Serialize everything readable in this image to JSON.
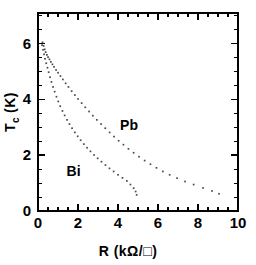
{
  "chart_data": {
    "type": "scatter",
    "title": "",
    "subtitle": "",
    "xlabel": "R (kΩ/□)",
    "xlabel_main": "R",
    "xlabel_units": "(kΩ/□)",
    "ylabel": "T_c (K)",
    "ylabel_main": "T",
    "ylabel_sub": "c",
    "ylabel_units": "(K)",
    "xlim": [
      0,
      10
    ],
    "ylim": [
      0,
      7.1
    ],
    "xticks": [
      0,
      2,
      4,
      6,
      8,
      10
    ],
    "xtick_labels": [
      "0",
      "2",
      "4",
      "6",
      "8",
      "10"
    ],
    "yticks": [
      0,
      2,
      4,
      6
    ],
    "ytick_labels": [
      "0",
      "2",
      "4",
      "6"
    ],
    "x_minor_interval": 0.5,
    "y_minor_interval": 0.5,
    "grid": false,
    "legend_position": "inline-annotation",
    "marker": "dotted-small",
    "marker_color": "#4a4a4a",
    "series": [
      {
        "name": "Pb",
        "label": "Pb",
        "label_x": 4.55,
        "label_y": 2.92,
        "points": [
          [
            0.22,
            6.05
          ],
          [
            0.28,
            5.92
          ],
          [
            0.33,
            5.8
          ],
          [
            0.38,
            5.7
          ],
          [
            0.44,
            5.6
          ],
          [
            0.5,
            5.52
          ],
          [
            0.57,
            5.44
          ],
          [
            0.64,
            5.35
          ],
          [
            0.72,
            5.26
          ],
          [
            0.8,
            5.17
          ],
          [
            0.9,
            5.06
          ],
          [
            1.0,
            4.96
          ],
          [
            1.12,
            4.84
          ],
          [
            1.24,
            4.72
          ],
          [
            1.38,
            4.58
          ],
          [
            1.52,
            4.45
          ],
          [
            1.68,
            4.3
          ],
          [
            1.84,
            4.16
          ],
          [
            2.0,
            4.02
          ],
          [
            2.18,
            3.87
          ],
          [
            2.36,
            3.72
          ],
          [
            2.55,
            3.57
          ],
          [
            2.74,
            3.42
          ],
          [
            2.94,
            3.27
          ],
          [
            3.15,
            3.12
          ],
          [
            3.36,
            2.97
          ],
          [
            3.58,
            2.82
          ],
          [
            3.8,
            2.67
          ],
          [
            4.03,
            2.52
          ],
          [
            4.27,
            2.38
          ],
          [
            4.52,
            2.23
          ],
          [
            4.78,
            2.09
          ],
          [
            5.05,
            1.95
          ],
          [
            5.33,
            1.81
          ],
          [
            5.62,
            1.68
          ],
          [
            5.92,
            1.55
          ],
          [
            6.24,
            1.42
          ],
          [
            6.58,
            1.3
          ],
          [
            6.95,
            1.18
          ],
          [
            7.35,
            1.06
          ],
          [
            7.78,
            0.95
          ],
          [
            8.25,
            0.83
          ],
          [
            8.7,
            0.72
          ],
          [
            9.05,
            0.62
          ]
        ]
      },
      {
        "name": "Bi",
        "label": "Bi",
        "label_x": 1.78,
        "label_y": 1.25,
        "points": [
          [
            0.2,
            5.95
          ],
          [
            0.25,
            5.78
          ],
          [
            0.3,
            5.62
          ],
          [
            0.35,
            5.46
          ],
          [
            0.41,
            5.3
          ],
          [
            0.47,
            5.14
          ],
          [
            0.53,
            4.98
          ],
          [
            0.6,
            4.8
          ],
          [
            0.67,
            4.63
          ],
          [
            0.75,
            4.45
          ],
          [
            0.83,
            4.28
          ],
          [
            0.92,
            4.1
          ],
          [
            1.01,
            3.93
          ],
          [
            1.11,
            3.76
          ],
          [
            1.22,
            3.59
          ],
          [
            1.33,
            3.43
          ],
          [
            1.45,
            3.27
          ],
          [
            1.57,
            3.12
          ],
          [
            1.7,
            2.97
          ],
          [
            1.84,
            2.82
          ],
          [
            1.98,
            2.68
          ],
          [
            2.13,
            2.54
          ],
          [
            2.29,
            2.4
          ],
          [
            2.45,
            2.27
          ],
          [
            2.62,
            2.14
          ],
          [
            2.8,
            2.01
          ],
          [
            2.98,
            1.89
          ],
          [
            3.17,
            1.77
          ],
          [
            3.37,
            1.65
          ],
          [
            3.57,
            1.53
          ],
          [
            3.78,
            1.42
          ],
          [
            4.0,
            1.3
          ],
          [
            4.22,
            1.19
          ],
          [
            4.44,
            1.08
          ],
          [
            4.62,
            0.95
          ],
          [
            4.78,
            0.82
          ],
          [
            4.88,
            0.7
          ],
          [
            4.93,
            0.58
          ]
        ]
      }
    ]
  }
}
